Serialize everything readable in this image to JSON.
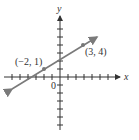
{
  "diagram": {
    "x_axis_label": "x",
    "y_axis_label": "y",
    "origin_label": "0",
    "points": [
      {
        "label": "(−2, 1)",
        "x": -2,
        "y": 1
      },
      {
        "label": "(3, 4)",
        "x": 3,
        "y": 4
      }
    ],
    "line_color": "#7a7a7a",
    "axis_color": "#333333"
  }
}
